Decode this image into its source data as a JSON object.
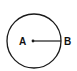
{
  "diagram": {
    "type": "circle-radius",
    "circle": {
      "cx": 34,
      "cy": 41,
      "r": 27,
      "stroke": "#1a1a1a"
    },
    "center_point": {
      "label": "A",
      "x": 33,
      "y": 41
    },
    "edge_point": {
      "label": "B",
      "x": 61,
      "y": 41
    },
    "segment": {
      "from": "A",
      "to": "B",
      "meaning": "radius"
    }
  }
}
